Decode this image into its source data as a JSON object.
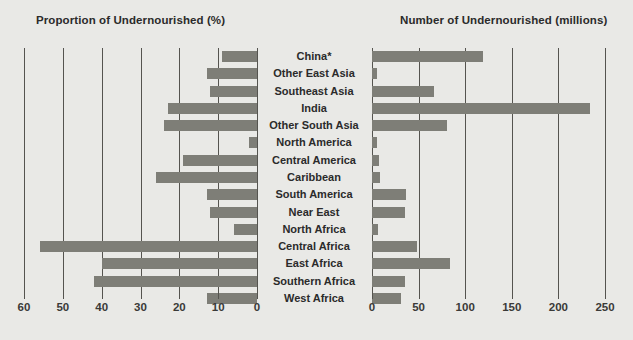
{
  "chart_data": {
    "type": "bar",
    "title": "",
    "orientation": "horizontal",
    "layout": "butterfly-paired-panels",
    "grid": true,
    "legend": false,
    "categories": [
      "China*",
      "Other East Asia",
      "Southeast Asia",
      "India",
      "Other South Asia",
      "North America",
      "Central America",
      "Caribbean",
      "South America",
      "Near East",
      "North Africa",
      "Central Africa",
      "East Africa",
      "Southern Africa",
      "West Africa"
    ],
    "panels": [
      {
        "id": "left",
        "title": "Proportion of Undernourished (%)",
        "xlabel": "",
        "ylabel": "",
        "direction": "right-to-left",
        "xlim": [
          0,
          60
        ],
        "ticks": [
          60,
          50,
          40,
          30,
          20,
          10,
          0
        ],
        "values": [
          9,
          13,
          12,
          23,
          24,
          2,
          19,
          26,
          13,
          12,
          6,
          56,
          40,
          42,
          13
        ]
      },
      {
        "id": "right",
        "title": "Number of Undernourished (millions)",
        "xlabel": "",
        "ylabel": "",
        "direction": "left-to-right",
        "xlim": [
          0,
          250
        ],
        "ticks": [
          0,
          50,
          100,
          150,
          200,
          250
        ],
        "values": [
          119,
          5,
          66,
          234,
          81,
          5,
          7,
          9,
          37,
          35,
          6,
          48,
          84,
          35,
          31
        ]
      }
    ]
  },
  "titles": {
    "left": "Proportion of Undernourished (%)",
    "right": "Number of Undernourished (millions)"
  },
  "axis_left": {
    "labels": [
      "60",
      "50",
      "40",
      "30",
      "20",
      "10",
      "0"
    ]
  },
  "axis_right": {
    "labels": [
      "0",
      "50",
      "100",
      "150",
      "200",
      "250"
    ]
  },
  "colors": {
    "background": "#e9e9e6",
    "bar": "#7e7e77",
    "gridline": "#55544f",
    "text": "#2b2b2b"
  }
}
